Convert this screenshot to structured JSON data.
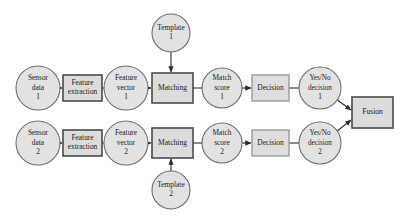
{
  "diagram": {
    "colors": {
      "background": "#ffffff",
      "circle_fill": "#e2e2e2",
      "circle_stroke": "#6d6d6d",
      "box_fill": "#dcdcdc",
      "box_stroke": "#4a4a4a",
      "box_light_stroke": "#9a9a9a",
      "connector": "#2b2b2b",
      "text": "#1a1a1a"
    },
    "nodes": [
      {
        "id": "sensor-data-1",
        "shape": "circle",
        "cx": 38,
        "cy": 88,
        "r": 22,
        "lines": [
          "Sensor",
          "data",
          "1"
        ],
        "font_size": 7.4
      },
      {
        "id": "feature-extraction-1",
        "shape": "rect",
        "x": 63,
        "y": 75,
        "w": 39,
        "h": 26,
        "lines": [
          "Feature",
          "extraction"
        ],
        "font_size": 7.4
      },
      {
        "id": "feature-vector-1",
        "shape": "circle",
        "cx": 126,
        "cy": 88,
        "r": 22,
        "lines": [
          "Feature",
          "vector",
          "1"
        ],
        "font_size": 7.4
      },
      {
        "id": "matching-1",
        "shape": "rect",
        "x": 152,
        "y": 73,
        "w": 41,
        "h": 30,
        "lines": [
          "Matching"
        ],
        "font_size": 7.6
      },
      {
        "id": "template-1",
        "shape": "circle",
        "cx": 171,
        "cy": 33,
        "r": 19,
        "lines": [
          "Template",
          "1"
        ],
        "font_size": 7.4
      },
      {
        "id": "match-score-1",
        "shape": "circle",
        "cx": 222,
        "cy": 88,
        "r": 20,
        "lines": [
          "Match",
          "score",
          "1"
        ],
        "font_size": 7.4
      },
      {
        "id": "decision-1",
        "shape": "rect-light",
        "x": 252,
        "y": 75,
        "w": 37,
        "h": 26,
        "lines": [
          "Decision"
        ],
        "font_size": 7.4
      },
      {
        "id": "yes-no-decision-1",
        "shape": "circle",
        "cx": 320,
        "cy": 88,
        "r": 21,
        "lines": [
          "Yes/No",
          "decision",
          "1"
        ],
        "font_size": 7.2
      },
      {
        "id": "fusion",
        "shape": "rect",
        "x": 352,
        "y": 97,
        "w": 41,
        "h": 31,
        "lines": [
          "Fusion"
        ],
        "font_size": 7.6
      },
      {
        "id": "sensor-data-2",
        "shape": "circle",
        "cx": 38,
        "cy": 143,
        "r": 22,
        "lines": [
          "Sensor",
          "data",
          "2"
        ],
        "font_size": 7.4
      },
      {
        "id": "feature-extraction-2",
        "shape": "rect",
        "x": 63,
        "y": 130,
        "w": 39,
        "h": 26,
        "lines": [
          "Feature",
          "extraction"
        ],
        "font_size": 7.4
      },
      {
        "id": "feature-vector-2",
        "shape": "circle",
        "cx": 126,
        "cy": 143,
        "r": 22,
        "lines": [
          "Feature",
          "vector",
          "2"
        ],
        "font_size": 7.4
      },
      {
        "id": "matching-2",
        "shape": "rect",
        "x": 152,
        "y": 128,
        "w": 41,
        "h": 30,
        "lines": [
          "Matching"
        ],
        "font_size": 7.6
      },
      {
        "id": "template-2",
        "shape": "circle",
        "cx": 171,
        "cy": 190,
        "r": 19,
        "lines": [
          "Template",
          "2"
        ],
        "font_size": 7.4
      },
      {
        "id": "match-score-2",
        "shape": "circle",
        "cx": 222,
        "cy": 143,
        "r": 20,
        "lines": [
          "Match",
          "score",
          "2"
        ],
        "font_size": 7.4
      },
      {
        "id": "decision-2",
        "shape": "rect-light",
        "x": 252,
        "y": 130,
        "w": 37,
        "h": 26,
        "lines": [
          "Decision"
        ],
        "font_size": 7.4
      },
      {
        "id": "yes-no-decision-2",
        "shape": "circle",
        "cx": 320,
        "cy": 143,
        "r": 21,
        "lines": [
          "Yes/No",
          "decision",
          "2"
        ],
        "font_size": 7.2
      }
    ],
    "connections": [
      {
        "id": "sensor1-to-fe1",
        "from": "sensor-data-1",
        "to": "feature-extraction-1",
        "x1": 60,
        "y1": 88,
        "x2": 62,
        "y2": 88,
        "arrow": true
      },
      {
        "id": "fe1-to-fv1",
        "from": "feature-extraction-1",
        "to": "feature-vector-1",
        "x1": 102,
        "y1": 88,
        "x2": 104,
        "y2": 88,
        "arrow": false
      },
      {
        "id": "fv1-to-matching1",
        "from": "feature-vector-1",
        "to": "matching-1",
        "x1": 148,
        "y1": 88,
        "x2": 151,
        "y2": 88,
        "arrow": true
      },
      {
        "id": "template1-to-matching1",
        "from": "template-1",
        "to": "matching-1",
        "x1": 171,
        "y1": 52,
        "x2": 171,
        "y2": 72,
        "arrow": true
      },
      {
        "id": "matching1-to-ms1",
        "from": "matching-1",
        "to": "match-score-1",
        "x1": 193,
        "y1": 88,
        "x2": 202,
        "y2": 88,
        "arrow": false
      },
      {
        "id": "ms1-to-decision1",
        "from": "match-score-1",
        "to": "decision-1",
        "x1": 242,
        "y1": 88,
        "x2": 251,
        "y2": 88,
        "arrow": true
      },
      {
        "id": "decision1-to-yn1",
        "from": "decision-1",
        "to": "yes-no-decision-1",
        "x1": 289,
        "y1": 88,
        "x2": 299,
        "y2": 88,
        "arrow": false
      },
      {
        "id": "yn1-to-fusion",
        "from": "yes-no-decision-1",
        "to": "fusion",
        "x1": 336,
        "y1": 99,
        "x2": 351,
        "y2": 110,
        "arrow": true
      },
      {
        "id": "sensor2-to-fe2",
        "from": "sensor-data-2",
        "to": "feature-extraction-2",
        "x1": 60,
        "y1": 143,
        "x2": 62,
        "y2": 143,
        "arrow": true
      },
      {
        "id": "fe2-to-fv2",
        "from": "feature-extraction-2",
        "to": "feature-vector-2",
        "x1": 102,
        "y1": 143,
        "x2": 104,
        "y2": 143,
        "arrow": false
      },
      {
        "id": "fv2-to-matching2",
        "from": "feature-vector-2",
        "to": "matching-2",
        "x1": 148,
        "y1": 143,
        "x2": 151,
        "y2": 143,
        "arrow": true
      },
      {
        "id": "template2-to-matching2",
        "from": "template-2",
        "to": "matching-2",
        "x1": 171,
        "y1": 171,
        "x2": 171,
        "y2": 159,
        "arrow": true
      },
      {
        "id": "matching2-to-ms2",
        "from": "matching-2",
        "to": "match-score-2",
        "x1": 193,
        "y1": 143,
        "x2": 202,
        "y2": 143,
        "arrow": false
      },
      {
        "id": "ms2-to-decision2",
        "from": "match-score-2",
        "to": "decision-2",
        "x1": 242,
        "y1": 143,
        "x2": 251,
        "y2": 143,
        "arrow": true
      },
      {
        "id": "decision2-to-yn2",
        "from": "decision-2",
        "to": "yes-no-decision-2",
        "x1": 289,
        "y1": 143,
        "x2": 299,
        "y2": 143,
        "arrow": false
      },
      {
        "id": "yn2-to-fusion",
        "from": "yes-no-decision-2",
        "to": "fusion",
        "x1": 336,
        "y1": 132,
        "x2": 351,
        "y2": 120,
        "arrow": true
      }
    ]
  }
}
